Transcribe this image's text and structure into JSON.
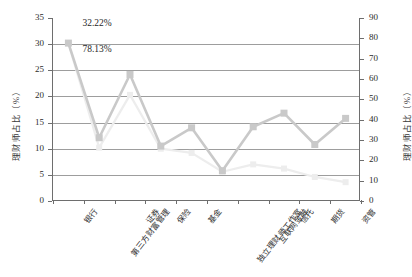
{
  "chart_data": {
    "type": "line",
    "title": "",
    "xlabel": "",
    "ylabel": "理财师占比（%）",
    "y2label": "理财师占比（%）",
    "categories": [
      "银行",
      "第三方财富管理",
      "证券",
      "保险",
      "基金",
      "独立理财师工作室",
      "互联网金融",
      "信托",
      "期货",
      "资管"
    ],
    "series": [
      {
        "name": "理财师占比",
        "axis": "left",
        "color": "#c9c9c9",
        "values": [
          30.2,
          12.1,
          24.2,
          10.5,
          14.0,
          5.8,
          14.2,
          16.8,
          10.8,
          15.8
        ]
      },
      {
        "name": "辅助系列",
        "axis": "left",
        "color": "#ededed",
        "values": [
          30.2,
          10.2,
          20.3,
          10.0,
          9.2,
          5.6,
          7.0,
          6.2,
          4.6,
          3.6
        ]
      }
    ],
    "ylim": [
      0,
      35
    ],
    "yticks": [
      0,
      5,
      10,
      15,
      20,
      25,
      30,
      35
    ],
    "y2lim": [
      0,
      90
    ],
    "y2ticks": [
      0,
      10,
      20,
      30,
      40,
      50,
      60,
      70,
      80,
      90
    ],
    "grid": true,
    "legend": "none",
    "annotations": [
      {
        "text": "32.22%",
        "x_index": 0,
        "value": 33.6
      },
      {
        "text": "78.13%",
        "x_index": 0,
        "value": 28.6
      }
    ]
  }
}
